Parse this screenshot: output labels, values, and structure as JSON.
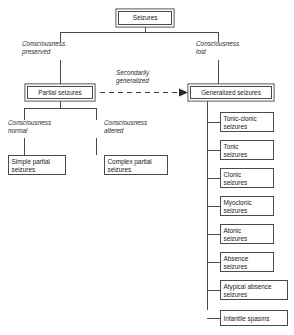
{
  "diagram": {
    "title_box": {
      "label": "Seizures"
    },
    "level1_labels": {
      "left": "Consciousness\npreserved",
      "left_line1": "Consciousness",
      "left_line2": "preserved",
      "right_line1": "Consciousness",
      "right_line2": "lost"
    },
    "level2_boxes": {
      "partial": "Partial seizures",
      "generalized": "Generalized seizures"
    },
    "dashed_arrow_label": {
      "line1": "Secondarily",
      "line2": "generalized"
    },
    "level3_labels": {
      "normal_line1": "Consciousness",
      "normal_line2": "normal",
      "altered_line1": "Consciousness",
      "altered_line2": "altered"
    },
    "level3_boxes": {
      "simple_partial": "Simple partial\nseizures",
      "simple_partial_line1": "Simple partial",
      "simple_partial_line2": "seizures",
      "complex_partial_line1": "Complex partial",
      "complex_partial_line2": "seizures"
    },
    "generalized_subtypes": [
      {
        "line1": "Tonic-clonic",
        "line2": "seizures"
      },
      {
        "line1": "Tonic",
        "line2": "seizures"
      },
      {
        "line1": "Clonic",
        "line2": "seizures"
      },
      {
        "line1": "Myoclonic",
        "line2": "seizures"
      },
      {
        "line1": "Atonic",
        "line2": "seizures"
      },
      {
        "line1": "Absence",
        "line2": "seizures"
      },
      {
        "line1": "Atypical absence",
        "line2": "seizures"
      },
      {
        "line1": "Infantile spasms",
        "line2": ""
      }
    ],
    "colors": {
      "line": "#4a4a4a",
      "text": "#1a1a1a",
      "background": "#ffffff"
    }
  }
}
